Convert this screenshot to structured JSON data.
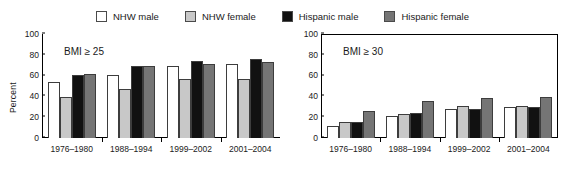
{
  "legend": {
    "entries": [
      {
        "label": "NHW male",
        "color": "#ffffff"
      },
      {
        "label": "NHW female",
        "color": "#c8c8c8"
      },
      {
        "label": "Hispanic male",
        "color": "#111111"
      },
      {
        "label": "Hispanic female",
        "color": "#757575"
      }
    ]
  },
  "chart_data": [
    {
      "type": "bar",
      "panel": "left",
      "title": "",
      "annotation": "BMI ≥ 25",
      "xlabel": "",
      "ylabel": "Percent",
      "ylim": [
        0,
        100
      ],
      "yticks": [
        0,
        20,
        40,
        60,
        80,
        100
      ],
      "ytick_labels": [
        "0",
        "20",
        "40",
        "60",
        "80",
        "100"
      ],
      "grid": false,
      "legend_position": "top-center-shared",
      "categories": [
        "1976–1980",
        "1988–1994",
        "1999–2002",
        "2001–2004"
      ],
      "series": [
        {
          "name": "NHW male",
          "color": "#ffffff",
          "values": [
            54,
            61,
            69,
            71
          ]
        },
        {
          "name": "NHW female",
          "color": "#c8c8c8",
          "values": [
            39,
            47,
            57,
            57
          ]
        },
        {
          "name": "Hispanic male",
          "color": "#111111",
          "values": [
            61,
            69,
            74,
            76
          ]
        },
        {
          "name": "Hispanic female",
          "color": "#757575",
          "values": [
            62,
            69,
            71,
            73
          ]
        }
      ]
    },
    {
      "type": "bar",
      "panel": "right",
      "title": "",
      "annotation": "BMI ≥ 30",
      "xlabel": "",
      "ylabel": "",
      "ylim": [
        0,
        100
      ],
      "yticks": [
        0,
        20,
        40,
        60,
        80,
        100
      ],
      "ytick_labels": [
        "0",
        "20",
        "40",
        "60",
        "80",
        "100"
      ],
      "grid": false,
      "legend_position": "top-center-shared",
      "categories": [
        "1976–1980",
        "1988–1994",
        "1999–2002",
        "2001–2004"
      ],
      "series": [
        {
          "name": "NHW male",
          "color": "#ffffff",
          "values": [
            12,
            21,
            28,
            30
          ]
        },
        {
          "name": "NHW female",
          "color": "#c8c8c8",
          "values": [
            15,
            23,
            31,
            31
          ]
        },
        {
          "name": "Hispanic male",
          "color": "#111111",
          "values": [
            15,
            24,
            28,
            30
          ]
        },
        {
          "name": "Hispanic female",
          "color": "#757575",
          "values": [
            26,
            36,
            38,
            39
          ]
        }
      ]
    }
  ]
}
